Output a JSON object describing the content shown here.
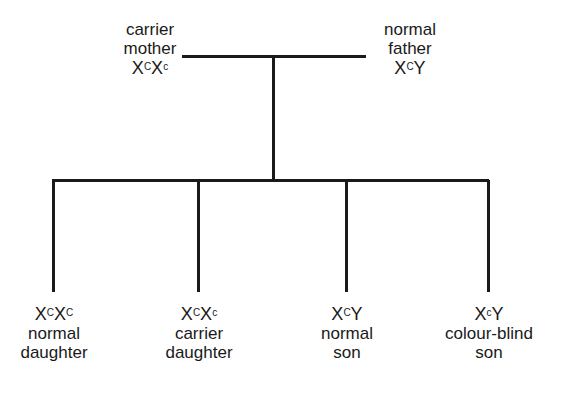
{
  "parents": [
    {
      "role": "carrier",
      "relation": "mother",
      "genotype": {
        "a": "X",
        "a_sup": "C",
        "b": "X",
        "b_sup": "c"
      }
    },
    {
      "role": "normal",
      "relation": "father",
      "genotype": {
        "a": "X",
        "a_sup": "C",
        "b": "Y",
        "b_sup": ""
      }
    }
  ],
  "children": [
    {
      "genotype": {
        "a": "X",
        "a_sup": "C",
        "b": "X",
        "b_sup": "C"
      },
      "phenotype": "normal",
      "relation": "daughter"
    },
    {
      "genotype": {
        "a": "X",
        "a_sup": "C",
        "b": "X",
        "b_sup": "c"
      },
      "phenotype": "carrier",
      "relation": "daughter"
    },
    {
      "genotype": {
        "a": "X",
        "a_sup": "C",
        "b": "Y",
        "b_sup": ""
      },
      "phenotype": "normal",
      "relation": "son"
    },
    {
      "genotype": {
        "a": "X",
        "a_sup": "c",
        "b": "Y",
        "b_sup": ""
      },
      "phenotype": "colour-blind",
      "relation": "son"
    }
  ],
  "colors": {
    "line": "#1a1a1a",
    "text": "#1a1a1a",
    "background": "#ffffff"
  }
}
